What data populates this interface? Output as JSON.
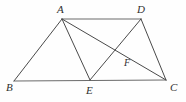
{
  "figure": {
    "background_color": "#fefefe",
    "stroke_color": "#4a4a4a",
    "label_color": "#303030",
    "width": 186,
    "height": 102,
    "points": {
      "A": {
        "label": "A",
        "x": 62,
        "y": 19,
        "label_x": 57,
        "label_y": 4
      },
      "B": {
        "label": "B",
        "x": 14,
        "y": 81,
        "label_x": 6,
        "label_y": 82
      },
      "C": {
        "label": "C",
        "x": 166,
        "y": 80,
        "label_x": 170,
        "label_y": 82
      },
      "D": {
        "label": "D",
        "x": 141,
        "y": 19,
        "label_x": 137,
        "label_y": 4
      },
      "E": {
        "label": "E",
        "x": 90,
        "y": 80,
        "label_x": 86,
        "label_y": 85
      },
      "F": {
        "label": "F",
        "x": 122,
        "y": 58,
        "label_x": 124,
        "label_y": 57
      }
    },
    "segments": [
      {
        "name": "segment-AD",
        "from": "A",
        "to": "D",
        "style": "base"
      },
      {
        "name": "segment-BC",
        "from": "B",
        "to": "C",
        "style": "base"
      },
      {
        "name": "segment-AB",
        "from": "A",
        "to": "B",
        "style": "normal"
      },
      {
        "name": "segment-AE",
        "from": "A",
        "to": "E",
        "style": "normal"
      },
      {
        "name": "segment-AC",
        "from": "A",
        "to": "C",
        "style": "normal"
      },
      {
        "name": "segment-DE",
        "from": "D",
        "to": "E",
        "style": "normal"
      },
      {
        "name": "segment-DC",
        "from": "D",
        "to": "C",
        "style": "normal"
      }
    ]
  }
}
